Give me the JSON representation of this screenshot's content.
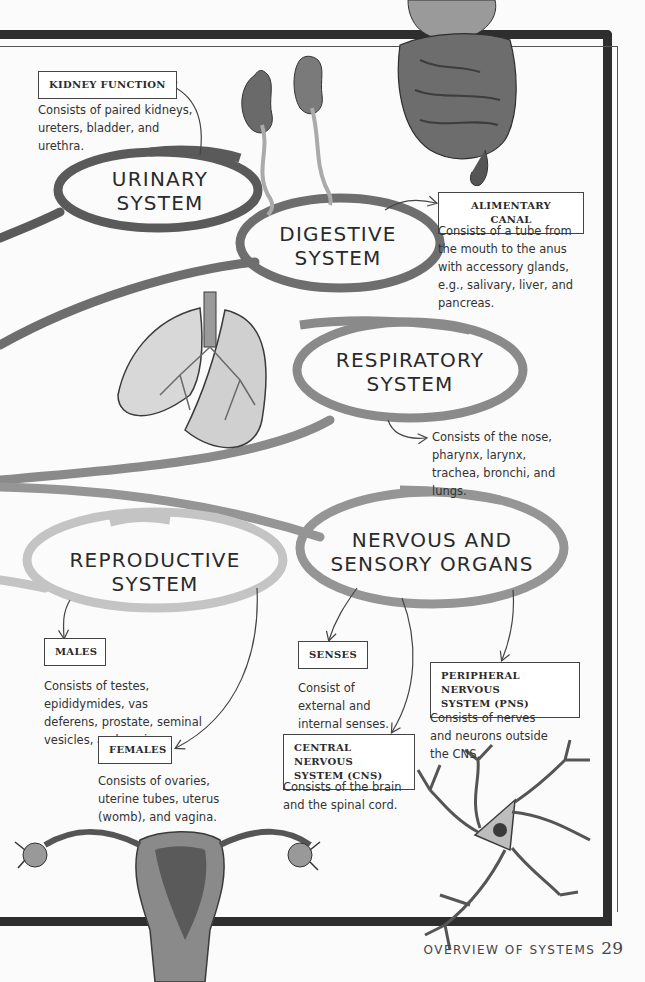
{
  "page": {
    "footer_title": "OVERVIEW OF SYSTEMS",
    "page_number": "29"
  },
  "colors": {
    "frame": "#2e2e2e",
    "urinary_ring": "#5a5a5a",
    "digestive_ring": "#6e6e6e",
    "respiratory_ring": "#8a8a8a",
    "nervous_ring": "#959595",
    "reproductive_ring": "#c4c4c4"
  },
  "systems": {
    "urinary": {
      "title_line1": "URINARY",
      "title_line2": "SYSTEM",
      "label": "KIDNEY FUNCTION",
      "description": "Consists of paired kidneys, ureters, bladder, and urethra.",
      "illustration": "kidneys"
    },
    "digestive": {
      "title_line1": "DIGESTIVE",
      "title_line2": "SYSTEM",
      "label": "ALIMENTARY CANAL",
      "description": "Consists of a tube from the mouth to the anus with accessory glands, e.g., salivary, liver, and pancreas.",
      "illustration": "intestines"
    },
    "respiratory": {
      "title_line1": "RESPIRATORY",
      "title_line2": "SYSTEM",
      "description": "Consists of the nose, pharynx, larynx, trachea, bronchi, and lungs.",
      "illustration": "lungs"
    },
    "reproductive": {
      "title_line1": "REPRODUCTIVE",
      "title_line2": "SYSTEM",
      "males": {
        "label": "MALES",
        "description": "Consists of testes, epididymides, vas deferens, prostate, seminal vesicles, and penis."
      },
      "females": {
        "label": "FEMALES",
        "description": "Consists of ovaries, uterine tubes, uterus (womb), and vagina."
      },
      "illustration": "uterus"
    },
    "nervous": {
      "title_line1": "NERVOUS AND",
      "title_line2": "SENSORY ORGANS",
      "senses": {
        "label": "SENSES",
        "description": "Consist of external and internal senses."
      },
      "cns": {
        "label_line1": "CENTRAL NERVOUS",
        "label_line2": "SYSTEM (CNS)",
        "description": "Consists of the brain and the spinal cord."
      },
      "pns": {
        "label_line1": "PERIPHERAL NERVOUS",
        "label_line2": "SYSTEM (PNS)",
        "description": "Consists of nerves and neurons outside the CNS."
      },
      "illustration": "neuron"
    }
  }
}
